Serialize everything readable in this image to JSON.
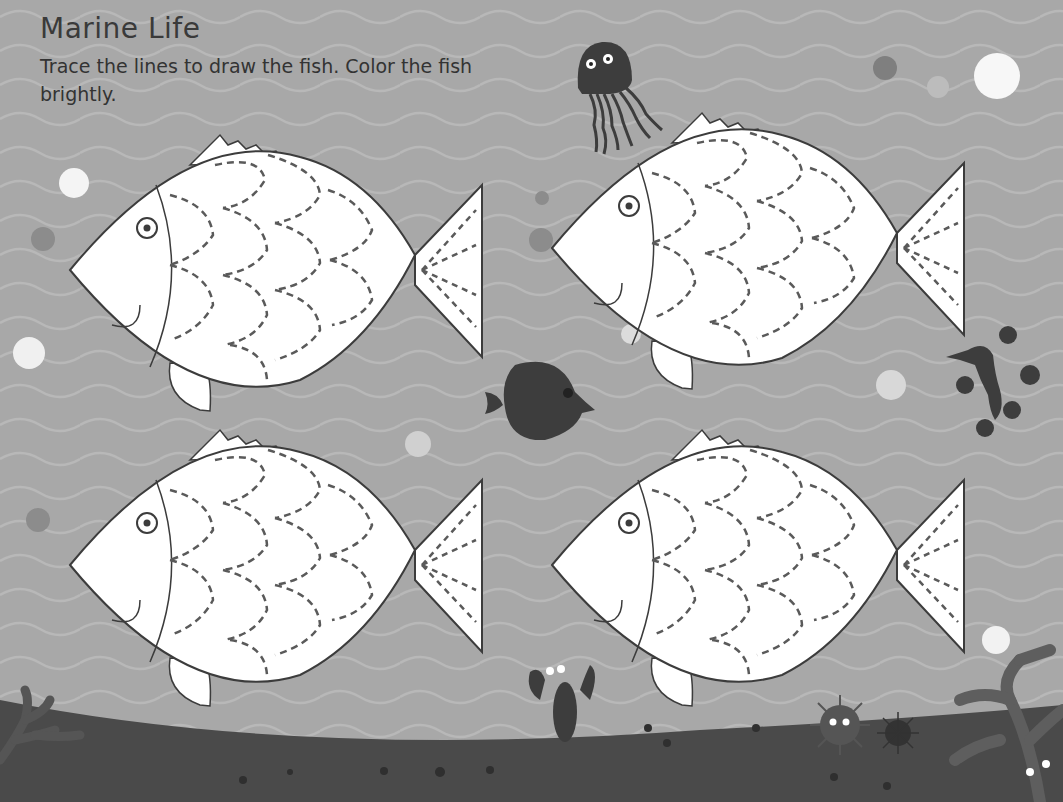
{
  "page": {
    "title": "Marine Life",
    "instructions": "Trace the lines to draw the fish. Color the fish brightly."
  },
  "colors": {
    "water": "#a8a8a8",
    "wave_line": "#b9b9b9",
    "seabed": "#4a4a4a",
    "outline": "#3c3c3c",
    "fish_fill": "#ffffff",
    "dash": "#5a5a5a",
    "creature": "#3d3d3d"
  },
  "tracing_fish": [
    {
      "id": "fish-top-left",
      "x": 70,
      "y": 135
    },
    {
      "id": "fish-top-right",
      "x": 552,
      "y": 113
    },
    {
      "id": "fish-bottom-left",
      "x": 70,
      "y": 430
    },
    {
      "id": "fish-bottom-right",
      "x": 552,
      "y": 430
    }
  ],
  "decorations": [
    "jellyfish",
    "round-fish",
    "sea-dragon",
    "lobster",
    "sea-urchin",
    "small-urchin",
    "coral-left",
    "coral-right",
    "bubbles",
    "seabed"
  ]
}
